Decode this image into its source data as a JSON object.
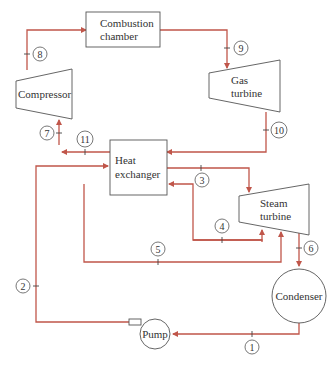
{
  "components": {
    "combustion_chamber": {
      "line1": "Combustion",
      "line2": "chamber"
    },
    "compressor": {
      "label": "Compressor"
    },
    "gas_turbine": {
      "line1": "Gas",
      "line2": "turbine"
    },
    "heat_exchanger": {
      "line1": "Heat",
      "line2": "exchanger"
    },
    "steam_turbine": {
      "line1": "Steam",
      "line2": "turbine"
    },
    "condenser": {
      "label": "Condenser"
    },
    "pump": {
      "label": "Pump"
    }
  },
  "states": [
    "1",
    "2",
    "3",
    "4",
    "5",
    "6",
    "7",
    "8",
    "9",
    "10",
    "11"
  ],
  "colors": {
    "pipe": "#c0564a",
    "outline": "#555555",
    "text": "#333333"
  }
}
